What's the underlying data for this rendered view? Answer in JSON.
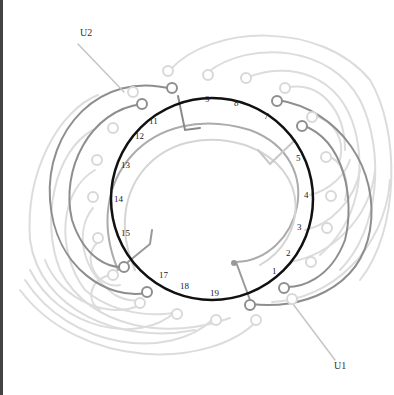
{
  "diagram": {
    "type": "winding-diagram",
    "terminals": [
      {
        "id": "u2",
        "label": "U2"
      },
      {
        "id": "u1",
        "label": "U1"
      }
    ],
    "slot_numbers": [
      "1",
      "2",
      "3",
      "4",
      "5",
      "7",
      "8",
      "9",
      "11",
      "12",
      "13",
      "14",
      "15",
      "17",
      "18",
      "19"
    ],
    "colors": {
      "ring": "#111111",
      "dark_wire": "#8a8a8a",
      "mid_wire": "#a8a8a8",
      "light_wire": "#d8d8d8"
    }
  }
}
